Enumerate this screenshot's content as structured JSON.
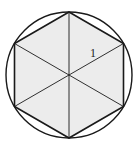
{
  "diagram": {
    "side_label": "1",
    "colors": {
      "fill": "#ececec",
      "stroke": "#1a1a1a",
      "background": "#ffffff"
    },
    "circle": {
      "cx": 69,
      "cy": 75,
      "r": 63
    },
    "hexagon_vertices": [
      [
        69,
        12
      ],
      [
        123.5,
        43.5
      ],
      [
        123.5,
        106.5
      ],
      [
        69,
        138
      ],
      [
        14.5,
        106.5
      ],
      [
        14.5,
        43.5
      ]
    ]
  }
}
